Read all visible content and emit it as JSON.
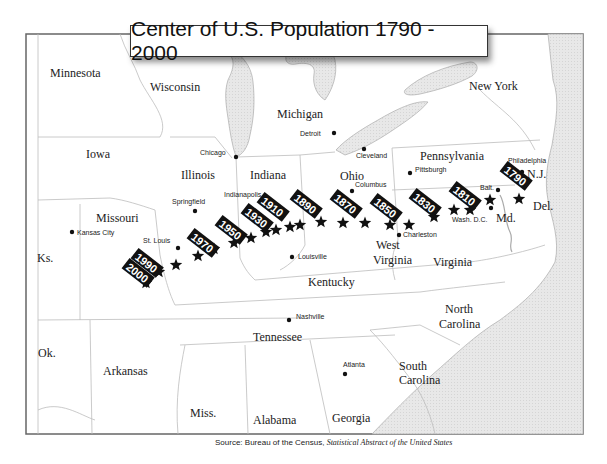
{
  "title": "Center of U.S. Population 1790 - 2000",
  "source": {
    "prefix": "Source: Bureau of the Census,",
    "publication": "Statistical Abstract of the United States"
  },
  "states": [
    {
      "name": "Minnesota",
      "x": 50,
      "y": 77
    },
    {
      "name": "Wisconsin",
      "x": 150,
      "y": 91
    },
    {
      "name": "Michigan",
      "x": 277,
      "y": 118
    },
    {
      "name": "New York",
      "x": 469,
      "y": 90
    },
    {
      "name": "Iowa",
      "x": 86,
      "y": 158
    },
    {
      "name": "Illinois",
      "x": 181,
      "y": 179
    },
    {
      "name": "Indiana",
      "x": 250,
      "y": 179
    },
    {
      "name": "Ohio",
      "x": 340,
      "y": 180
    },
    {
      "name": "Pennsylvania",
      "x": 420,
      "y": 160
    },
    {
      "name": "N.J.",
      "x": 527,
      "y": 178
    },
    {
      "name": "Missouri",
      "x": 96,
      "y": 222
    },
    {
      "name": "Ks.",
      "x": 37,
      "y": 262
    },
    {
      "name": "Kentucky",
      "x": 308,
      "y": 286
    },
    {
      "name": "West",
      "x": 376,
      "y": 249
    },
    {
      "name": "Virginia",
      "x": 373,
      "y": 264
    },
    {
      "name": "Virginia",
      "x": 433,
      "y": 266
    },
    {
      "name": "Md.",
      "x": 496,
      "y": 222
    },
    {
      "name": "Del.",
      "x": 533,
      "y": 210
    },
    {
      "name": "North",
      "x": 445,
      "y": 313
    },
    {
      "name": "Carolina",
      "x": 439,
      "y": 328
    },
    {
      "name": "Tennessee",
      "x": 253,
      "y": 341
    },
    {
      "name": "Ok.",
      "x": 38,
      "y": 357
    },
    {
      "name": "Arkansas",
      "x": 103,
      "y": 375
    },
    {
      "name": "South",
      "x": 399,
      "y": 370
    },
    {
      "name": "Carolina",
      "x": 399,
      "y": 384
    },
    {
      "name": "Miss.",
      "x": 190,
      "y": 417
    },
    {
      "name": "Alabama",
      "x": 253,
      "y": 424
    },
    {
      "name": "Georgia",
      "x": 332,
      "y": 422
    }
  ],
  "cities": [
    {
      "name": "Detroit",
      "dot_x": 334,
      "dot_y": 133,
      "label_x": 300,
      "label_y": 136
    },
    {
      "name": "Chicago",
      "dot_x": 236,
      "dot_y": 157,
      "label_x": 200,
      "label_y": 155
    },
    {
      "name": "Cleveland",
      "dot_x": 364,
      "dot_y": 149,
      "label_x": 356,
      "label_y": 158
    },
    {
      "name": "Pittsburgh",
      "dot_x": 410,
      "dot_y": 173,
      "label_x": 415,
      "label_y": 172
    },
    {
      "name": "Philadelphia",
      "dot_x": 522,
      "dot_y": 172,
      "label_x": 508,
      "label_y": 163
    },
    {
      "name": "Columbus",
      "dot_x": 352,
      "dot_y": 191,
      "label_x": 355,
      "label_y": 187
    },
    {
      "name": "Indianapolis",
      "dot_x": 276,
      "dot_y": 205,
      "label_x": 224,
      "label_y": 197
    },
    {
      "name": "Springfield",
      "dot_x": 195,
      "dot_y": 211,
      "label_x": 172,
      "label_y": 204
    },
    {
      "name": "Balt.",
      "dot_x": 498,
      "dot_y": 190,
      "label_x": 480,
      "label_y": 190
    },
    {
      "name": "Wash. D.C.",
      "dot_x": 491,
      "dot_y": 208,
      "label_x": 452,
      "label_y": 222
    },
    {
      "name": "Kansas City",
      "dot_x": 72,
      "dot_y": 232,
      "label_x": 77,
      "label_y": 235
    },
    {
      "name": "St. Louis",
      "dot_x": 178,
      "dot_y": 248,
      "label_x": 143,
      "label_y": 243
    },
    {
      "name": "Charleston",
      "dot_x": 399,
      "dot_y": 235,
      "label_x": 403,
      "label_y": 237
    },
    {
      "name": "Louisville",
      "dot_x": 292,
      "dot_y": 257,
      "label_x": 298,
      "label_y": 259
    },
    {
      "name": "Nashville",
      "dot_x": 289,
      "dot_y": 320,
      "label_x": 296,
      "label_y": 319
    },
    {
      "name": "Atlanta",
      "dot_x": 345,
      "dot_y": 374,
      "label_x": 343,
      "label_y": 367
    }
  ],
  "year_labels": [
    {
      "year": "1790",
      "x": 503,
      "y": 170,
      "rot": 38
    },
    {
      "year": "1810",
      "x": 452,
      "y": 190,
      "rot": 38
    },
    {
      "year": "1830",
      "x": 412,
      "y": 197,
      "rot": 38
    },
    {
      "year": "1850",
      "x": 373,
      "y": 202,
      "rot": 38
    },
    {
      "year": "1870",
      "x": 333,
      "y": 198,
      "rot": 38
    },
    {
      "year": "1890",
      "x": 293,
      "y": 198,
      "rot": 38
    },
    {
      "year": "1910",
      "x": 260,
      "y": 201,
      "rot": 38
    },
    {
      "year": "1930",
      "x": 244,
      "y": 212,
      "rot": 38
    },
    {
      "year": "1950",
      "x": 218,
      "y": 224,
      "rot": 38
    },
    {
      "year": "1970",
      "x": 190,
      "y": 237,
      "rot": 38
    },
    {
      "year": "1990",
      "x": 134,
      "y": 257,
      "rot": 38
    },
    {
      "year": "2000",
      "x": 125,
      "y": 267,
      "rot": 38
    }
  ],
  "centers": [
    {
      "year": 1790,
      "x": 519,
      "y": 199
    },
    {
      "year": 1800,
      "x": 490,
      "y": 200
    },
    {
      "year": 1810,
      "x": 470,
      "y": 210
    },
    {
      "year": 1820,
      "x": 454,
      "y": 210
    },
    {
      "year": 1830,
      "x": 434,
      "y": 217
    },
    {
      "year": 1840,
      "x": 409,
      "y": 225
    },
    {
      "year": 1850,
      "x": 390,
      "y": 225
    },
    {
      "year": 1860,
      "x": 365,
      "y": 223
    },
    {
      "year": 1870,
      "x": 343,
      "y": 223
    },
    {
      "year": 1880,
      "x": 321,
      "y": 222
    },
    {
      "year": 1890,
      "x": 300,
      "y": 225
    },
    {
      "year": 1900,
      "x": 290,
      "y": 227
    },
    {
      "year": 1910,
      "x": 276,
      "y": 230
    },
    {
      "year": 1920,
      "x": 266,
      "y": 232
    },
    {
      "year": 1930,
      "x": 251,
      "y": 238
    },
    {
      "year": 1940,
      "x": 234,
      "y": 243
    },
    {
      "year": 1950,
      "x": 214,
      "y": 249
    },
    {
      "year": 1960,
      "x": 198,
      "y": 256
    },
    {
      "year": 1970,
      "x": 176,
      "y": 265
    },
    {
      "year": 1980,
      "x": 159,
      "y": 272
    },
    {
      "year": 1990,
      "x": 146,
      "y": 283
    }
  ],
  "colors": {
    "land": "#ffffff",
    "water": "#e6e6e6",
    "border": "#bdbdbd",
    "frame": "#666666",
    "marker": "#111111"
  }
}
